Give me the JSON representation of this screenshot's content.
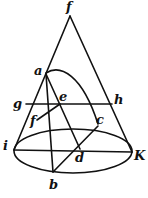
{
  "diagram": {
    "labels": {
      "apex": "f",
      "a": "a",
      "g": "g",
      "e": "e",
      "h": "h",
      "f_lower": "f",
      "c": "c",
      "i": "i",
      "d": "d",
      "k": "K",
      "b": "b"
    }
  }
}
